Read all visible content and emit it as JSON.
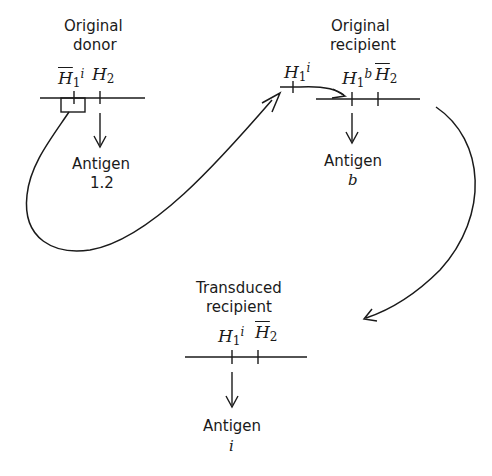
{
  "stages": {
    "donor": {
      "title_line1": "Original",
      "title_line2": "donor",
      "gene1": {
        "symbol": "H",
        "sub": "1",
        "sup": "i",
        "barred": true
      },
      "gene2": {
        "symbol": "H",
        "sub": "2",
        "barred": false
      },
      "antigen_label": "Antigen",
      "antigen_value": "1.2"
    },
    "fragment": {
      "gene": {
        "symbol": "H",
        "sub": "1",
        "sup": "i",
        "barred": false
      }
    },
    "recipient": {
      "title_line1": "Original",
      "title_line2": "recipient",
      "gene1": {
        "symbol": "H",
        "sub": "1",
        "sup": "b",
        "barred": false
      },
      "gene2": {
        "symbol": "H",
        "sub": "2",
        "barred": true
      },
      "antigen_label": "Antigen",
      "antigen_value": "b"
    },
    "transduced": {
      "title_line1": "Transduced",
      "title_line2": "recipient",
      "gene1": {
        "symbol": "H",
        "sub": "1",
        "sup": "i",
        "barred": false
      },
      "gene2": {
        "symbol": "H",
        "sub": "2",
        "barred": true
      },
      "antigen_label": "Antigen",
      "antigen_value": "i"
    }
  },
  "colors": {
    "stroke": "#1a1a1a",
    "background": "#ffffff"
  }
}
